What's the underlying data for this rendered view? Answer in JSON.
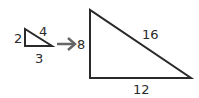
{
  "diagram": {
    "small_triangle": {
      "left_side": "2",
      "hypotenuse": "4",
      "bottom_side": "3"
    },
    "arrow": "arrow-right-icon",
    "large_triangle": {
      "left_side": "8",
      "hypotenuse": "16",
      "bottom_side": "12"
    },
    "colors": {
      "stroke": "#2a2a2a",
      "arrow": "#666666"
    }
  }
}
